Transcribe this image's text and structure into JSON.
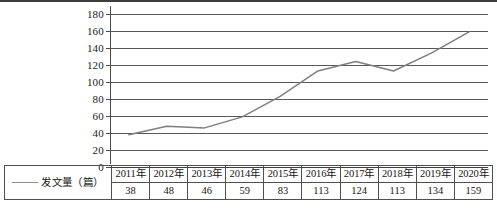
{
  "chart_data": {
    "type": "line",
    "title": "",
    "xlabel": "",
    "ylabel": "",
    "categories": [
      "2011年",
      "2012年",
      "2013年",
      "2014年",
      "2015年",
      "2016年",
      "2017年",
      "2018年",
      "2019年",
      "2020年"
    ],
    "values": [
      38,
      48,
      46,
      59,
      83,
      113,
      124,
      113,
      134,
      159
    ],
    "series": [
      {
        "name": "发文量（篇）",
        "values": [
          38,
          48,
          46,
          59,
          83,
          113,
          124,
          113,
          134,
          159
        ],
        "color": "#7f7f7f"
      }
    ],
    "ylim": [
      0,
      180
    ],
    "ytick_step": 20,
    "yticks": [
      180,
      160,
      140,
      120,
      100,
      80,
      60,
      40,
      20,
      0
    ],
    "ytick_labels": [
      "180",
      "160",
      "140",
      "120",
      "100",
      "80",
      "60",
      "40",
      "20",
      "0"
    ],
    "grid": true,
    "legend_position": "table-row-left"
  },
  "table": {
    "legend_label": "发文量（篇）",
    "legend_marker": "line-marker-icon",
    "header_row": [
      "2011年",
      "2012年",
      "2013年",
      "2014年",
      "2015年",
      "2016年",
      "2017年",
      "2018年",
      "2019年",
      "2020年"
    ],
    "value_row": [
      "38",
      "48",
      "46",
      "59",
      "83",
      "113",
      "124",
      "113",
      "134",
      "159"
    ]
  },
  "colors": {
    "series_line": "#7f7f7f",
    "gridline": "#585858",
    "axis": "#3f3f3f",
    "table_border": "#50504f",
    "top_rule": "#3d3d3d"
  }
}
